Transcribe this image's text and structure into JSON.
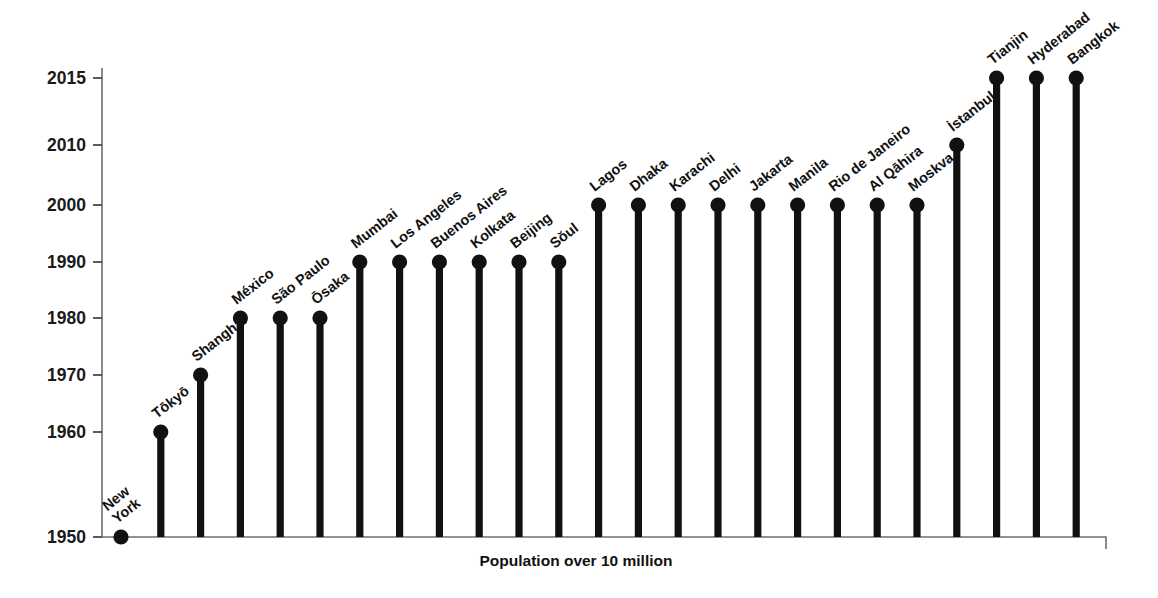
{
  "chart_data": {
    "type": "scatter",
    "title": "",
    "subtitle": "",
    "xlabel": "Population over 10 million",
    "ylabel": "",
    "grid": false,
    "legend": null,
    "y_ticks": [
      1950,
      1960,
      1970,
      1980,
      1990,
      2000,
      2010,
      2015
    ],
    "y_tick_labels": [
      "1950",
      "1960",
      "1970",
      "1980",
      "1990",
      "2000",
      "2010",
      "2015"
    ],
    "ylim": [
      1950,
      2015
    ],
    "note": "Lollipop / stem chart: each city is a vertical stem topped by a dot at the year its population first exceeded 10 million. Cities are ordered left to right by that year.",
    "categories": [
      "New York",
      "Tōkyō",
      "Shanghai",
      "México",
      "São Paulo",
      "Ōsaka",
      "Mumbai",
      "Los Angeles",
      "Buenos Aires",
      "Kolkata",
      "Beijing",
      "Sŏul",
      "Lagos",
      "Dhaka",
      "Karachi",
      "Delhi",
      "Jakarta",
      "Manila",
      "Rio de Janeiro",
      "Al Qāhira",
      "Moskva",
      "İstanbul",
      "Tianjin",
      "Hyderabad",
      "Bangkok"
    ],
    "values": [
      1950,
      1960,
      1970,
      1980,
      1980,
      1980,
      1990,
      1990,
      1990,
      1990,
      1990,
      1990,
      2000,
      2000,
      2000,
      2000,
      2000,
      2000,
      2000,
      2000,
      2000,
      2010,
      2015,
      2015,
      2015
    ],
    "points": [
      {
        "city": "New York",
        "year": 1950,
        "label_lines": [
          "New",
          "York"
        ]
      },
      {
        "city": "Tōkyō",
        "year": 1960,
        "label_lines": [
          "Tōkyō"
        ]
      },
      {
        "city": "Shanghai",
        "year": 1970,
        "label_lines": [
          "Shanghai"
        ]
      },
      {
        "city": "México",
        "year": 1980,
        "label_lines": [
          "México"
        ]
      },
      {
        "city": "São Paulo",
        "year": 1980,
        "label_lines": [
          "São Paulo"
        ]
      },
      {
        "city": "Ōsaka",
        "year": 1980,
        "label_lines": [
          "Ōsaka"
        ]
      },
      {
        "city": "Mumbai",
        "year": 1990,
        "label_lines": [
          "Mumbai"
        ]
      },
      {
        "city": "Los Angeles",
        "year": 1990,
        "label_lines": [
          "Los Angeles"
        ]
      },
      {
        "city": "Buenos Aires",
        "year": 1990,
        "label_lines": [
          "Buenos Aires"
        ]
      },
      {
        "city": "Kolkata",
        "year": 1990,
        "label_lines": [
          "Kolkata"
        ]
      },
      {
        "city": "Beijing",
        "year": 1990,
        "label_lines": [
          "Beijing"
        ]
      },
      {
        "city": "Sŏul",
        "year": 1990,
        "label_lines": [
          "Sŏul"
        ]
      },
      {
        "city": "Lagos",
        "year": 2000,
        "label_lines": [
          "Lagos"
        ]
      },
      {
        "city": "Dhaka",
        "year": 2000,
        "label_lines": [
          "Dhaka"
        ]
      },
      {
        "city": "Karachi",
        "year": 2000,
        "label_lines": [
          "Karachi"
        ]
      },
      {
        "city": "Delhi",
        "year": 2000,
        "label_lines": [
          "Delhi"
        ]
      },
      {
        "city": "Jakarta",
        "year": 2000,
        "label_lines": [
          "Jakarta"
        ]
      },
      {
        "city": "Manila",
        "year": 2000,
        "label_lines": [
          "Manila"
        ]
      },
      {
        "city": "Rio de Janeiro",
        "year": 2000,
        "label_lines": [
          "Rio de Janeiro"
        ]
      },
      {
        "city": "Al Qāhira",
        "year": 2000,
        "label_lines": [
          "Al Qāhira"
        ]
      },
      {
        "city": "Moskva",
        "year": 2000,
        "label_lines": [
          "Moskva"
        ]
      },
      {
        "city": "İstanbul",
        "year": 2010,
        "label_lines": [
          "İstanbul"
        ]
      },
      {
        "city": "Tianjin",
        "year": 2015,
        "label_lines": [
          "Tianjin"
        ]
      },
      {
        "city": "Hyderabad",
        "year": 2015,
        "label_lines": [
          "Hyderabad"
        ]
      },
      {
        "city": "Bangkok",
        "year": 2015,
        "label_lines": [
          "Bangkok"
        ]
      }
    ],
    "colors": {
      "stem": "#111111",
      "dot": "#111111",
      "axis": "#6f6f6f",
      "text": "#111111",
      "background": "#ffffff"
    }
  },
  "geometry": {
    "axis_x": 102,
    "baseline_y": 537,
    "axis_right_x": 1106,
    "first_stem_x": 121,
    "stem_spacing": 39.8,
    "label_angle_deg": -38,
    "dot_radius": 7.6,
    "tick_pixel_map": {
      "1950": 537,
      "1960": 432,
      "1970": 375,
      "1980": 318,
      "1990": 262,
      "2000": 205,
      "2010": 145,
      "2015": 78
    },
    "axis_title_x": 576,
    "axis_title_y": 566
  }
}
